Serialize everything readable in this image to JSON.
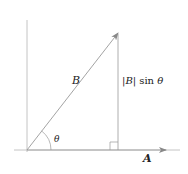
{
  "diagram": {
    "vector_B_label": "B",
    "vector_A_label": "A",
    "angle_label": "θ",
    "projection_label_bar_open": "|",
    "projection_label_B": "B",
    "projection_label_bar_close": "|",
    "projection_label_fn": " sin ",
    "projection_label_theta": "θ",
    "line_color": "#9a9a9a",
    "text_color": "#222222"
  }
}
